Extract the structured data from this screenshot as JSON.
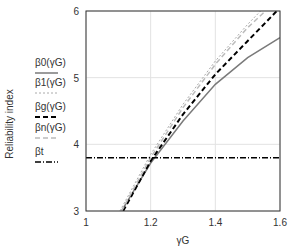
{
  "chart_data": {
    "type": "line",
    "title": "",
    "xlabel": "γG",
    "ylabel": "Reliability index",
    "xlim": [
      1,
      1.6
    ],
    "ylim": [
      3,
      6
    ],
    "xticks": [
      "1",
      "1.2",
      "1.4",
      "1.6"
    ],
    "yticks": [
      "3",
      "4",
      "5",
      "6"
    ],
    "grid": true,
    "legend_position": "left-outside",
    "series": [
      {
        "name": "β0(γG)",
        "style": "solid",
        "color": "#7a7a7a",
        "x": [
          1.11,
          1.2,
          1.3,
          1.4,
          1.5,
          1.6
        ],
        "y": [
          3.0,
          3.72,
          4.35,
          4.9,
          5.3,
          5.6
        ]
      },
      {
        "name": "β1(γG)",
        "style": "dotted",
        "color": "#aaaaaa",
        "x": [
          1.105,
          1.2,
          1.3,
          1.4,
          1.5,
          1.54
        ],
        "y": [
          3.0,
          3.85,
          4.6,
          5.25,
          5.8,
          6.0
        ]
      },
      {
        "name": "βg(γG)",
        "style": "dashed",
        "color": "#000000",
        "x": [
          1.115,
          1.2,
          1.3,
          1.4,
          1.5,
          1.59
        ],
        "y": [
          3.0,
          3.75,
          4.45,
          5.05,
          5.55,
          6.0
        ]
      },
      {
        "name": "βn(γG)",
        "style": "dashed",
        "color": "#bbbbbb",
        "x": [
          1.11,
          1.2,
          1.3,
          1.4,
          1.5,
          1.555
        ],
        "y": [
          3.0,
          3.8,
          4.55,
          5.2,
          5.75,
          6.0
        ]
      },
      {
        "name": "βt",
        "style": "dashdot",
        "color": "#000000",
        "x": [
          1,
          1.6
        ],
        "y": [
          3.8,
          3.8
        ]
      }
    ]
  },
  "labels": {
    "ylabel": "Reliability index",
    "xlabel": "γG"
  },
  "legend": [
    {
      "text": "β0(γG)"
    },
    {
      "text": "β1(γG)"
    },
    {
      "text": "βg(γG)"
    },
    {
      "text": "βn(γG)"
    },
    {
      "text": "βt"
    }
  ]
}
